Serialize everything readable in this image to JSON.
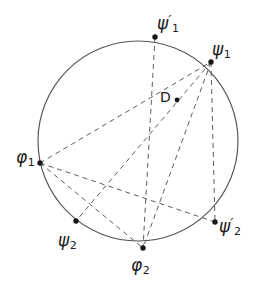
{
  "figure": {
    "kind": "geometric-diagram",
    "canvas": {
      "width": 260,
      "height": 286,
      "background": "#ffffff"
    },
    "colors": {
      "circle_stroke": "#54545a",
      "chord_stroke": "#5b5b62",
      "vertex_fill": "#18181c",
      "label_color": "#1b1b20"
    },
    "circle": {
      "cx": 138,
      "cy": 141,
      "r": 100
    },
    "points": [
      {
        "id": "psi1prime",
        "label_base": "ψ",
        "label_sub": "1",
        "label_prime": "′",
        "x": 155,
        "y": 37,
        "label_x": 157,
        "label_y": 13
      },
      {
        "id": "psi1",
        "label_base": "ψ",
        "label_sub": "1",
        "label_prime": "",
        "x": 211,
        "y": 62,
        "label_x": 212,
        "label_y": 41
      },
      {
        "id": "phi1",
        "label_base": "φ",
        "label_sub": "1",
        "label_prime": "",
        "x": 40,
        "y": 163,
        "label_x": 16,
        "label_y": 149
      },
      {
        "id": "psi2",
        "label_base": "ψ",
        "label_sub": "2",
        "label_prime": "",
        "x": 76,
        "y": 221,
        "label_x": 58,
        "label_y": 232
      },
      {
        "id": "phi2",
        "label_base": "φ",
        "label_sub": "2",
        "label_prime": "",
        "x": 143,
        "y": 248,
        "label_x": 131,
        "label_y": 257
      },
      {
        "id": "psi2prime",
        "label_base": "ψ",
        "label_sub": "2",
        "label_prime": "′",
        "x": 215,
        "y": 222,
        "label_x": 219,
        "label_y": 216
      },
      {
        "id": "D",
        "label_base": "D",
        "label_sub": "",
        "label_prime": "",
        "x": 177,
        "y": 100,
        "label_x": 160,
        "label_y": 90
      }
    ],
    "chords": [
      {
        "from": "phi1",
        "to": "psi1",
        "note": "long chord passing just under D"
      },
      {
        "from": "phi1",
        "to": "phi2",
        "note": "lower-left chord to bottom point"
      },
      {
        "from": "phi1",
        "to": "psi2prime",
        "note": "chord crossing to lower right point"
      },
      {
        "from": "psi1prime",
        "to": "phi2",
        "note": "chord through interior point D"
      },
      {
        "from": "psi1",
        "to": "phi2",
        "note": "right chord down to bottom point"
      },
      {
        "from": "psi1",
        "to": "psi2",
        "note": "chord down-left to lower-left point"
      },
      {
        "from": "psi1",
        "to": "psi2prime",
        "note": "short right chord"
      }
    ]
  }
}
